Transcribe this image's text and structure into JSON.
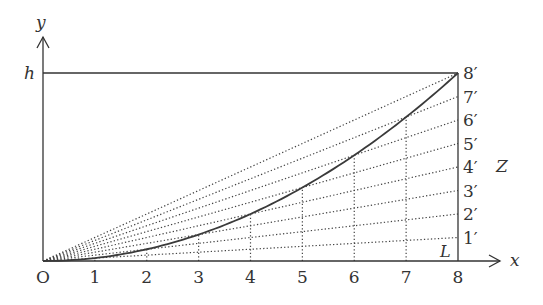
{
  "diagram": {
    "colors": {
      "stroke": "#333333",
      "dotted": "#444444",
      "curve": "#3a3a3a",
      "background": "#ffffff"
    },
    "axes": {
      "x_label": "x",
      "y_label": "y",
      "origin_label": "O",
      "height_label": "h",
      "length_label": "L",
      "side_label": "Z"
    },
    "x_ticks": [
      "1",
      "2",
      "3",
      "4",
      "5",
      "6",
      "7",
      "8"
    ],
    "y_divisions": [
      "1′",
      "2′",
      "3′",
      "4′",
      "5′",
      "6′",
      "7′",
      "8′"
    ],
    "divisions": 8,
    "geometry": {
      "origin": [
        43,
        261
      ],
      "right_x": 458,
      "top_y": 73,
      "x_arrow_end": 500,
      "y_arrow_end": 37
    }
  }
}
